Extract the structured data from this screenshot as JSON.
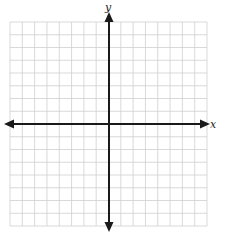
{
  "diagram": {
    "type": "coordinate-plane",
    "x_axis_label": "x",
    "y_axis_label": "y",
    "grid": {
      "columns": 16,
      "rows": 16,
      "left": 10,
      "top": 22,
      "right": 207,
      "bottom": 226,
      "line_color": "#cfcfcf"
    },
    "axes": {
      "origin_x": 109,
      "origin_y": 124,
      "color": "#1a1a1a",
      "x_start": 4,
      "x_end": 210,
      "y_start": 12,
      "y_end": 232
    }
  }
}
